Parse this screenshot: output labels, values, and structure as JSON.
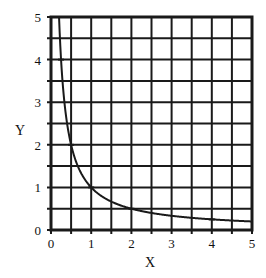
{
  "chart_data": {
    "type": "line",
    "title": "",
    "xlabel": "X",
    "ylabel": "Y",
    "xlim": [
      0,
      5
    ],
    "ylim": [
      0,
      5
    ],
    "x_ticks": [
      "0",
      "1",
      "2",
      "3",
      "4",
      "5"
    ],
    "y_ticks": [
      "0",
      "1",
      "2",
      "3",
      "4",
      "5"
    ],
    "grid": true,
    "grid_step": 0.5,
    "legend": null,
    "series": [
      {
        "name": "y = 1/x",
        "x": [
          0.2,
          0.25,
          0.5,
          1,
          2,
          4,
          5
        ],
        "y": [
          5,
          4,
          2,
          1,
          0.5,
          0.25,
          0.2
        ],
        "markers_at": [
          [
            0.25,
            4
          ],
          [
            0.5,
            2
          ],
          [
            1,
            1
          ],
          [
            2,
            0.5
          ],
          [
            4,
            0.25
          ]
        ]
      }
    ]
  },
  "colors": {
    "grid": "#1a1a1a",
    "curve": "#1a1a1a",
    "background": "#ffffff"
  }
}
